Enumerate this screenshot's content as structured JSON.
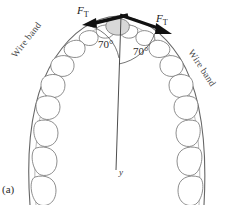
{
  "figure": {
    "panel_label": "(a)",
    "caption_subject": "dental-arch-wire-band-force-diagram"
  },
  "labels": {
    "wire_band_left": "Wire band",
    "wire_band_right": "Wire band",
    "force_left_symbol": "F",
    "force_left_subscript": "T",
    "force_right_symbol": "F",
    "force_right_subscript": "T",
    "angle_left": "70°",
    "angle_right": "70°",
    "axis_y": "y"
  },
  "geometry": {
    "angle_left_deg": 70,
    "angle_right_deg": 70,
    "apex_x": 118,
    "apex_y": 22,
    "axis_end_x": 116,
    "axis_end_y": 170
  },
  "colors": {
    "arrow": "#111111",
    "tooth_outline": "#6e6e6e",
    "tooth_highlight_fill": "#d8d8d8",
    "wire_line": "#555555",
    "axis_line": "#3a3a3a",
    "arc_line": "#3a3a3a",
    "background": "#ffffff",
    "text": "#1a1a1a"
  }
}
